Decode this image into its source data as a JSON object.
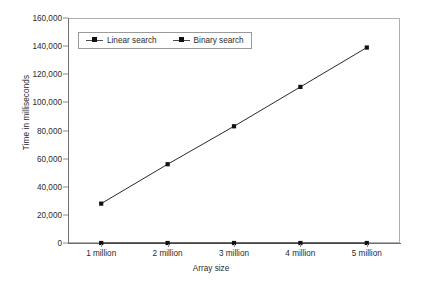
{
  "chart_data": {
    "type": "line",
    "title": "",
    "xlabel": "Array size",
    "ylabel": "Time in milliseconds",
    "categories": [
      "1 million",
      "2 million",
      "3 million",
      "4 million",
      "5 million"
    ],
    "series": [
      {
        "name": "Linear search",
        "values": [
          28000,
          56000,
          83000,
          111000,
          139000
        ],
        "marker": "square",
        "color": "#111111"
      },
      {
        "name": "Binary search",
        "values": [
          0,
          0,
          0,
          0,
          0
        ],
        "marker": "square",
        "color": "#111111"
      }
    ],
    "ylim": [
      0,
      160000
    ],
    "y_ticks": [
      0,
      20000,
      40000,
      60000,
      80000,
      100000,
      120000,
      140000,
      160000
    ],
    "y_tick_labels": [
      "0",
      "20,000",
      "40,000",
      "60,000",
      "80,000",
      "100,000",
      "120,000",
      "140,000",
      "160,000"
    ],
    "grid": false,
    "legend_position": "top-left-inside",
    "background": "#ffffff",
    "axis_color": "#6e6e6e",
    "frame_color": "#b0b0b0"
  },
  "legend": {
    "entries": [
      {
        "label": "Linear search"
      },
      {
        "label": "Binary search"
      }
    ]
  },
  "axes": {
    "x_title": "Array size",
    "y_title": "Time in milliseconds"
  }
}
